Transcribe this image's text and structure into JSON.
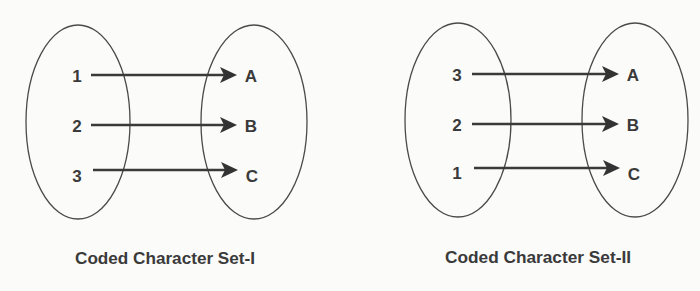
{
  "diagram": {
    "type": "set-mapping",
    "colors": {
      "background": "#fbfbfa",
      "stroke": "#3a3a3a",
      "text": "#3a3a3a"
    },
    "panels": [
      {
        "caption": "Coded Character Set-I",
        "domain_labels": [
          "1",
          "2",
          "3"
        ],
        "codomain_labels": [
          "A",
          "B",
          "C"
        ],
        "mappings": [
          {
            "from": "1",
            "to": "A"
          },
          {
            "from": "2",
            "to": "B"
          },
          {
            "from": "3",
            "to": "C"
          }
        ]
      },
      {
        "caption": "Coded Character Set-II",
        "domain_labels": [
          "3",
          "2",
          "1"
        ],
        "codomain_labels": [
          "A",
          "B",
          "C"
        ],
        "mappings": [
          {
            "from": "3",
            "to": "A"
          },
          {
            "from": "2",
            "to": "B"
          },
          {
            "from": "1",
            "to": "C"
          }
        ]
      }
    ]
  }
}
